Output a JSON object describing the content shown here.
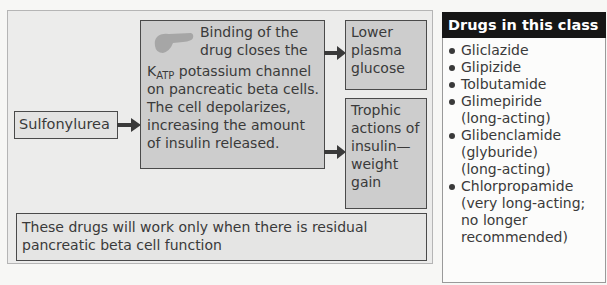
{
  "diagram": {
    "drug": "Sulfonylurea",
    "mechanism": {
      "line1": "Binding of the",
      "line2": "drug closes the",
      "k_symbol": "K",
      "k_subscript": "ATP",
      "line3_rest": " potassium channel",
      "line4": "on pancreatic beta cells.",
      "line5": "The cell depolarizes,",
      "line6": "increasing the amount",
      "line7": "of insulin released."
    },
    "outcomes": [
      {
        "lines": [
          "Lower",
          "plasma",
          "glucose"
        ]
      },
      {
        "lines": [
          "Trophic",
          "actions of",
          "insulin—",
          "weight",
          "gain"
        ]
      }
    ],
    "note": {
      "line1": "These drugs will work only when there is residual",
      "line2": "pancreatic beta cell function"
    },
    "icons": {
      "pancreas": "pancreas-icon",
      "arrow": "arrow-right-icon"
    },
    "colors": {
      "panel_bg": "#ececeb",
      "box_fill": "#cdcdcd",
      "border": "#4a4a4a",
      "header_bg": "#161616",
      "pancreas": "#a6a6a6"
    }
  },
  "sidebar": {
    "title": "Drugs in this class",
    "items": [
      {
        "name": "Gliclazide",
        "notes": []
      },
      {
        "name": "Glipizide",
        "notes": []
      },
      {
        "name": "Tolbutamide",
        "notes": []
      },
      {
        "name": "Glimepiride",
        "notes": [
          "(long-acting)"
        ]
      },
      {
        "name": "Glibenclamide",
        "notes": [
          "(glyburide)",
          "(long-acting)"
        ]
      },
      {
        "name": "Chlorpropamide",
        "notes": [
          "(very long-acting;",
          "no longer",
          "recommended)"
        ]
      }
    ]
  }
}
